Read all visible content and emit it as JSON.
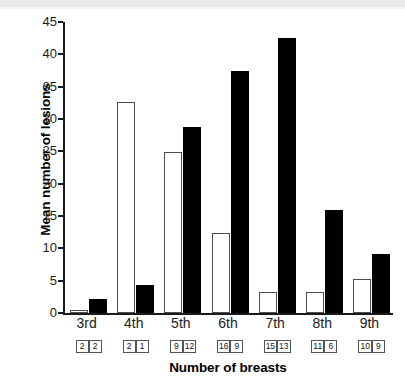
{
  "chart_data": {
    "type": "bar",
    "title": "",
    "subtitle": "",
    "xlabel": "Number of breasts",
    "ylabel": "Mean number of lesions",
    "categories": [
      "3rd",
      "4th",
      "5th",
      "6th",
      "7th",
      "8th",
      "9th"
    ],
    "series": [
      {
        "name": "white",
        "style": "open/white bars",
        "values": [
          0.5,
          32.7,
          24.9,
          12.3,
          3.3,
          3.3,
          5.3
        ]
      },
      {
        "name": "black",
        "style": "filled/black bars",
        "values": [
          2.1,
          4.3,
          28.7,
          37.5,
          42.5,
          16.0,
          9.1
        ]
      }
    ],
    "ylim": [
      0,
      45
    ],
    "yticks": [
      0,
      5,
      10,
      15,
      20,
      25,
      30,
      35,
      40,
      45
    ],
    "ytick_labels": [
      "0",
      "5",
      "10",
      "15",
      "20",
      "25",
      "30",
      "35",
      "40",
      "45"
    ],
    "grid": false,
    "legend": "none",
    "sample_sizes": [
      {
        "category": "3rd",
        "white": "2",
        "black": "2"
      },
      {
        "category": "4th",
        "white": "2",
        "black": "1"
      },
      {
        "category": "5th",
        "white": "9",
        "black": "12"
      },
      {
        "category": "6th",
        "white": "16",
        "black": "9"
      },
      {
        "category": "7th",
        "white": "15",
        "black": "13"
      },
      {
        "category": "8th",
        "white": "11",
        "black": "6"
      },
      {
        "category": "9th",
        "white": "10",
        "black": "9"
      }
    ],
    "colors": {
      "white_bar_fill": "#ffffff",
      "white_bar_edge": "#4d4d4d",
      "black_bar_fill": "#000000",
      "axis": "#1a1a1a",
      "background": "#ffffff"
    }
  }
}
